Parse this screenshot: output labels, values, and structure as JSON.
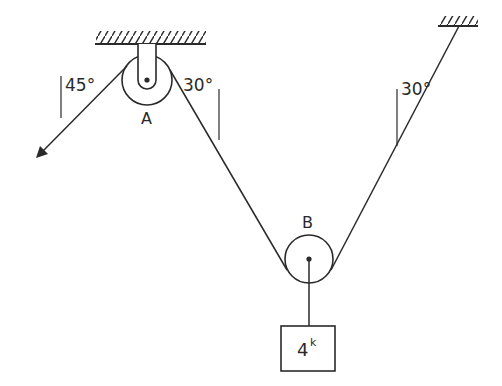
{
  "diagram": {
    "colors": {
      "ink": "#2a2a2a",
      "background": "#ffffff"
    },
    "pulleys": [
      {
        "id": "A",
        "label": "A",
        "support": "ceiling-bracket"
      },
      {
        "id": "B",
        "label": "B",
        "support": "rope-loop"
      }
    ],
    "angles": {
      "pull_left": "45°",
      "left_segment": "30°",
      "right_segment": "30°"
    },
    "load": {
      "value": "4",
      "unit": "k"
    },
    "supports": [
      "ceiling at pulley A",
      "ceiling anchor right"
    ]
  }
}
